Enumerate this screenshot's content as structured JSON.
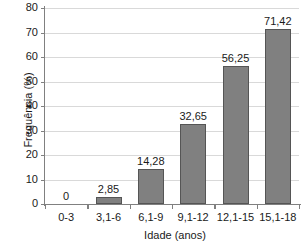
{
  "chart_data": {
    "type": "bar",
    "title": "",
    "subtitle": "",
    "xlabel": "Idade (anos)",
    "ylabel": "Frequência (%)",
    "categories": [
      "0-3",
      "3,1-6",
      "6,1-9",
      "9,1-12",
      "12,1-15",
      "15,1-18"
    ],
    "values": [
      0,
      2.85,
      14.28,
      32.65,
      56.25,
      71.42
    ],
    "value_labels": [
      "0",
      "2,85",
      "14,28",
      "32,65",
      "56,25",
      "71,42"
    ],
    "ylim": [
      0,
      80
    ],
    "ytick_labels": [
      "0",
      "10",
      "20",
      "30",
      "40",
      "50",
      "60",
      "70",
      "80"
    ],
    "ytick_values": [
      0,
      10,
      20,
      30,
      40,
      50,
      60,
      70,
      80
    ],
    "grid": true,
    "legend": false,
    "legend_position": "none",
    "bar_color": "#808080",
    "bar_edge_color": "#555555",
    "grid_color": "#d9d9d9",
    "axis_color": "#808080",
    "background_color": "#ffffff"
  }
}
